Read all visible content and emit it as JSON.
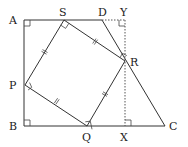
{
  "diagram": {
    "points": {
      "A": {
        "label": "A",
        "x": 24,
        "y": 20
      },
      "B": {
        "label": "B",
        "x": 24,
        "y": 126
      },
      "C": {
        "label": "C",
        "x": 165,
        "y": 126
      },
      "D": {
        "label": "D",
        "x": 102,
        "y": 20
      },
      "S": {
        "label": "S",
        "x": 64,
        "y": 20
      },
      "R": {
        "label": "R",
        "x": 125,
        "y": 61
      },
      "Q": {
        "label": "Q",
        "x": 87,
        "y": 126
      },
      "P": {
        "label": "P",
        "x": 25,
        "y": 85
      },
      "Y": {
        "label": "Y",
        "x": 125,
        "y": 20
      },
      "X": {
        "label": "X",
        "x": 125,
        "y": 126
      }
    },
    "right_angles": [
      "A",
      "B",
      "S",
      "R",
      "Q",
      "P",
      "Y",
      "X"
    ],
    "equal_side_marks": [
      "SR",
      "RQ",
      "QP",
      "PS"
    ],
    "dotted_lines": [
      "DY",
      "YX"
    ]
  }
}
